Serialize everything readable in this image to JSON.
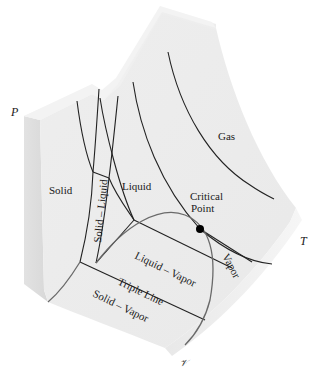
{
  "figure": {
    "axes": {
      "pressure": "P",
      "temperature": "T",
      "volume": "𝒱"
    },
    "regions": {
      "solid": "Solid",
      "liquid": "Liquid",
      "gas": "Gas",
      "vapor": "Vapor",
      "solid_liquid": "Solid – Liquid",
      "liquid_vapor": "Liquid – Vapor",
      "solid_vapor": "Solid – Vapor"
    },
    "features": {
      "critical_point_line1": "Critical",
      "critical_point_line2": "Point",
      "triple_line": "Triple Line"
    },
    "colors": {
      "surface_top": "#efefef",
      "surface_face": "#e6e6e6",
      "side_face": "#dcdcdc",
      "lines": "#222222",
      "dome": "#6a6a6a",
      "critical_point": "#000000"
    }
  }
}
